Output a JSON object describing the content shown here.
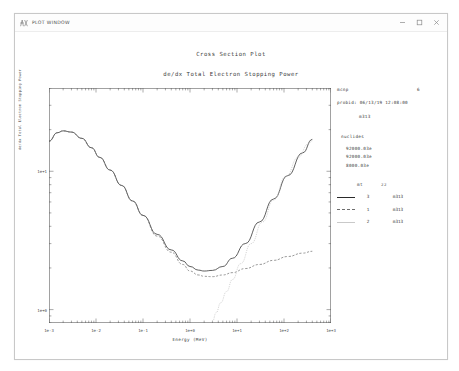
{
  "window": {
    "title": "PLOT WINDOW",
    "icon": "plot-window-icon",
    "controls": {
      "minimize": "minimize-icon",
      "maximize": "maximize-icon",
      "close": "close-icon"
    }
  },
  "info": {
    "code_key": "mcnp",
    "code_val": "6",
    "probid": "probid: 06/13/19 12:08:00",
    "tally": "m313",
    "nuclides_head": "nuclides",
    "nuclides": [
      "92000.03e",
      "92000.03e",
      "8000.03e"
    ],
    "legend": {
      "col_mt": "mt",
      "col_zz": "zz",
      "rows": [
        {
          "style": "solid",
          "mt": "3",
          "zz": "m313"
        },
        {
          "style": "dashed",
          "mt": "1",
          "zz": "m313"
        },
        {
          "style": "dotted",
          "mt": "2",
          "zz": "m313"
        }
      ]
    }
  },
  "chart_data": {
    "type": "line",
    "title": "Cross Section Plot",
    "subtitle": "de/dx Total Electron Stopping Power",
    "xlabel": "Energy (MeV)",
    "ylabel": "de/dx Total Electron Stopping Power",
    "xscale": "log",
    "yscale": "log",
    "xlim": [
      0.001,
      1000
    ],
    "ylim": [
      0.8,
      40
    ],
    "xticks": [
      "1e-3",
      "1e-2",
      "1e-1",
      "1e+0",
      "1e+1",
      "1e+2",
      "1e+3"
    ],
    "xtick_values": [
      0.001,
      0.01,
      0.1,
      1,
      10,
      100,
      1000
    ],
    "yticks": [
      "1e+1",
      "1e+0"
    ],
    "ytick_values": [
      10,
      1
    ],
    "grid": false,
    "legend_position": "right",
    "series": [
      {
        "name": "mt 3 m313",
        "label": "total",
        "style": "solid",
        "color": "#2a2a2a",
        "x": [
          0.001,
          0.0015,
          0.002,
          0.003,
          0.005,
          0.008,
          0.012,
          0.02,
          0.035,
          0.06,
          0.1,
          0.2,
          0.4,
          0.7,
          1.0,
          1.5,
          2.0,
          3.0,
          5.0,
          8.0,
          15.0,
          30.0,
          60.0,
          120.0,
          250.0,
          400.0
        ],
        "y": [
          16.5,
          19.0,
          19.6,
          19.2,
          17.3,
          14.8,
          12.6,
          10.2,
          7.9,
          6.1,
          4.8,
          3.5,
          2.7,
          2.25,
          2.05,
          1.93,
          1.9,
          1.92,
          2.05,
          2.35,
          3.0,
          4.3,
          6.3,
          9.3,
          13.6,
          17.0
        ]
      },
      {
        "name": "mt 1 m313",
        "label": "collision",
        "style": "dashed",
        "color": "#6d6d6d",
        "x": [
          0.001,
          0.0015,
          0.002,
          0.003,
          0.005,
          0.008,
          0.012,
          0.02,
          0.035,
          0.06,
          0.1,
          0.2,
          0.4,
          0.7,
          1.0,
          1.5,
          2.0,
          3.0,
          5.0,
          8.0,
          15.0,
          30.0,
          60.0,
          120.0,
          250.0,
          400.0
        ],
        "y": [
          16.5,
          19.0,
          19.6,
          19.2,
          17.3,
          14.8,
          12.6,
          10.2,
          7.9,
          6.1,
          4.8,
          3.4,
          2.6,
          2.12,
          1.9,
          1.78,
          1.74,
          1.73,
          1.78,
          1.85,
          1.98,
          2.12,
          2.27,
          2.42,
          2.56,
          2.64
        ]
      },
      {
        "name": "mt 2 m313",
        "label": "radiative",
        "style": "dotted",
        "color": "#c0c0c0",
        "x": [
          3.0,
          3.6,
          4.5,
          6.0,
          8.0,
          12.0,
          20.0,
          35.0,
          60.0,
          110.0,
          200.0,
          330.0,
          400.0
        ],
        "y": [
          0.82,
          0.95,
          1.12,
          1.35,
          1.65,
          2.15,
          3.0,
          4.3,
          6.2,
          9.2,
          12.6,
          15.8,
          16.6
        ]
      }
    ]
  }
}
